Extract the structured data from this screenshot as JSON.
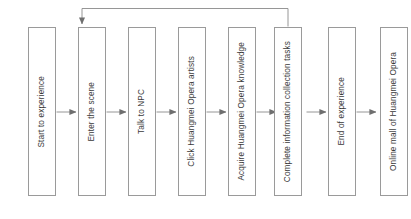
{
  "diagram": {
    "type": "flowchart",
    "orientation": "left-to-right",
    "title": "",
    "colors": {
      "box_border": "#9a9a9a",
      "box_fill": "#ffffff",
      "connector": "#8a8a8a",
      "text": "#3a3a3a",
      "background": "#ffffff"
    },
    "nodes": [
      {
        "id": "n1",
        "label": "Start to experience"
      },
      {
        "id": "n2",
        "label": "Enter the scene"
      },
      {
        "id": "n3",
        "label": "Talk to NPC"
      },
      {
        "id": "n4",
        "label": "Click Huangmei Opera artists"
      },
      {
        "id": "n5",
        "label": "Acquire Huangmei Opera knowledge"
      },
      {
        "id": "n6",
        "label": "Complete information collection tasks"
      },
      {
        "id": "n7",
        "label": "End of experience"
      },
      {
        "id": "n8",
        "label": "Online mall of Huangmei Opera"
      }
    ],
    "edges": [
      {
        "from": "n1",
        "to": "n2",
        "kind": "sequential"
      },
      {
        "from": "n2",
        "to": "n3",
        "kind": "sequential"
      },
      {
        "from": "n3",
        "to": "n4",
        "kind": "sequential"
      },
      {
        "from": "n4",
        "to": "n5",
        "kind": "sequential"
      },
      {
        "from": "n5",
        "to": "n6",
        "kind": "sequential"
      },
      {
        "from": "n6",
        "to": "n7",
        "kind": "sequential"
      },
      {
        "from": "n7",
        "to": "n8",
        "kind": "sequential"
      },
      {
        "from": "n6",
        "to": "n2",
        "kind": "feedback-loop"
      }
    ]
  }
}
